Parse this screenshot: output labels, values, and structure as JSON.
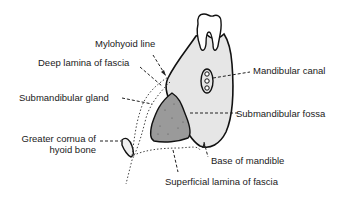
{
  "diagram": {
    "colors": {
      "bone_fill": "#e6e6e6",
      "gland_fill": "#9a9a9a",
      "outline": "#111111",
      "text": "#1a1a1a",
      "background": "#ffffff"
    },
    "labels": {
      "mylohyoid_line": "Mylohyoid line",
      "deep_lamina": "Deep lamina of fascia",
      "submandibular_gland": "Submandibular gland",
      "greater_cornua_line1": "Greater cornua of",
      "greater_cornua_line2": "hyoid bone",
      "mandibular_canal": "Mandibular canal",
      "submandibular_fossa": "Submandibular fossa",
      "base_of_mandible": "Base of mandible",
      "superficial_lamina": "Superficial lamina of fascia"
    },
    "structures": [
      "tooth",
      "mandible",
      "mandibular-canal",
      "submandibular-gland",
      "hyoid-greater-cornua",
      "deep-fascia-lamina",
      "superficial-fascia-lamina"
    ]
  }
}
